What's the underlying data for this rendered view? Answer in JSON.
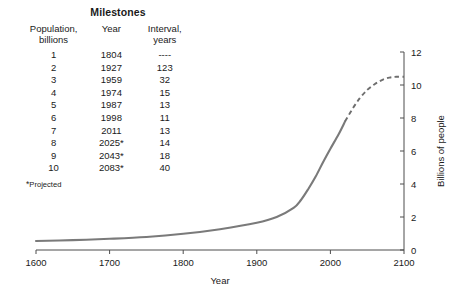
{
  "table": {
    "title": "Milestones",
    "headers": {
      "population_line1": "Population,",
      "population_line2": "billions",
      "year": "Year",
      "interval_line1": "Interval,",
      "interval_line2": "years"
    },
    "rows": [
      {
        "population": "1",
        "year": "1804",
        "interval": "----"
      },
      {
        "population": "2",
        "year": "1927",
        "interval": "123"
      },
      {
        "population": "3",
        "year": "1959",
        "interval": "32"
      },
      {
        "population": "4",
        "year": "1974",
        "interval": "15"
      },
      {
        "population": "5",
        "year": "1987",
        "interval": "13"
      },
      {
        "population": "6",
        "year": "1998",
        "interval": "11"
      },
      {
        "population": "7",
        "year": "2011",
        "interval": "13"
      },
      {
        "population": "8",
        "year": "2025*",
        "interval": "14"
      },
      {
        "population": "9",
        "year": "2043*",
        "interval": "18"
      },
      {
        "population": "10",
        "year": "2083*",
        "interval": "40"
      }
    ],
    "footnote_marker": "*",
    "footnote_text": "Projected"
  },
  "chart_data": {
    "type": "line",
    "title": "",
    "xlabel": "Year",
    "ylabel": "Billions of people",
    "xlim": [
      1600,
      2100
    ],
    "ylim": [
      0,
      12
    ],
    "xticks": [
      1600,
      1700,
      1800,
      1900,
      2000,
      2100
    ],
    "xticklabels": [
      "1600",
      "1700",
      "1800",
      "1900",
      "2000",
      "2100"
    ],
    "yticks": [
      0,
      2,
      4,
      6,
      8,
      10,
      12
    ],
    "yticklabels": [
      "0",
      "2",
      "4",
      "6",
      "8",
      "10",
      "12"
    ],
    "grid": false,
    "legend": false,
    "y_axis_position": "right",
    "series": [
      {
        "name": "World population (historical)",
        "style": "solid",
        "color": "#7a7a7a",
        "x": [
          1600,
          1650,
          1700,
          1750,
          1800,
          1850,
          1900,
          1927,
          1950,
          1960,
          1970,
          1980,
          1990,
          2000,
          2011,
          2020
        ],
        "y": [
          0.55,
          0.6,
          0.68,
          0.79,
          0.98,
          1.26,
          1.65,
          2.0,
          2.55,
          3.03,
          3.7,
          4.45,
          5.32,
          6.14,
          7.0,
          7.8
        ]
      },
      {
        "name": "World population (projected)",
        "style": "dashed",
        "color": "#6e6e6e",
        "x": [
          2020,
          2030,
          2040,
          2050,
          2060,
          2070,
          2080,
          2090,
          2100
        ],
        "y": [
          7.8,
          8.55,
          9.2,
          9.7,
          10.05,
          10.3,
          10.45,
          10.5,
          10.5
        ]
      }
    ]
  }
}
